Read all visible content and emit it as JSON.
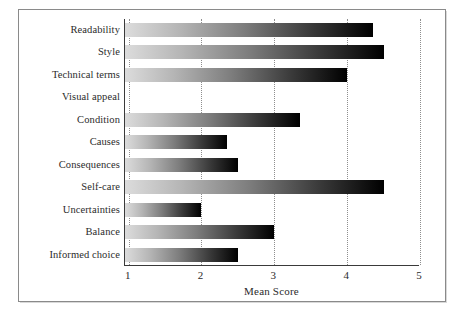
{
  "chart_data": {
    "type": "bar",
    "orientation": "horizontal",
    "title": "",
    "xlabel": "Mean Score",
    "ylabel": "",
    "xlim": [
      0.95,
      5
    ],
    "grid": "vertical-dotted",
    "legend": "none",
    "xticks": [
      "1",
      "2",
      "3",
      "4",
      "5"
    ],
    "xtick_values": [
      1,
      2,
      3,
      4,
      5
    ],
    "categories": [
      "Readability",
      "Style",
      "Technical terms",
      "Visual appeal",
      "Condition",
      "Causes",
      "Consequences",
      "Self-care",
      "Uncertainties",
      "Balance",
      "Informed choice"
    ],
    "values": [
      4.35,
      4.5,
      4.0,
      null,
      3.35,
      2.35,
      2.5,
      4.5,
      2.0,
      3.0,
      2.5
    ],
    "bar_fill": "gradient light-gray to black, left to right",
    "bar_colors": {
      "gradient_start": "#dcdcdc",
      "gradient_end": "#000000"
    },
    "axis_color": "#3a3a3a",
    "gridline_color": "#8e8e8e",
    "background": "#ffffff"
  },
  "axis": {
    "x_title": "Mean Score"
  }
}
